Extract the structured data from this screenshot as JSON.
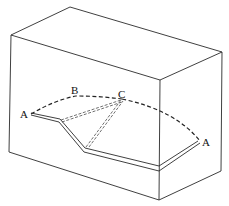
{
  "diagram": {
    "type": "block with curved fault/crack surface",
    "labels": {
      "a_left": "A",
      "b": "B",
      "c": "C",
      "a_right": "A"
    },
    "colors": {
      "line": "#2a2a2a",
      "background": "#ffffff"
    }
  }
}
